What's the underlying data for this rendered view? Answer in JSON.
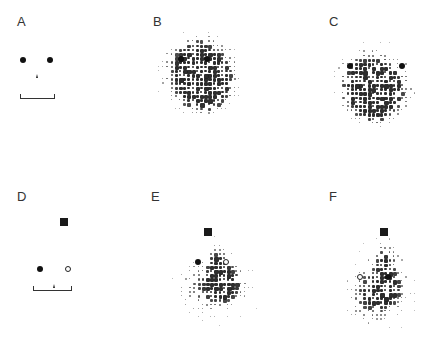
{
  "figure": {
    "panels": [
      {
        "id": "A",
        "label": "A",
        "type": "stimulus",
        "stimulus": "two-eyes-nose-mouth"
      },
      {
        "id": "B",
        "label": "B",
        "type": "fixation-density",
        "stimulus": "two-eyes"
      },
      {
        "id": "C",
        "label": "C",
        "type": "fixation-density",
        "stimulus": "two-eyes"
      },
      {
        "id": "D",
        "label": "D",
        "type": "stimulus",
        "stimulus": "square-filled-eye-open-eye-nose-mouth"
      },
      {
        "id": "E",
        "label": "E",
        "type": "fixation-density",
        "stimulus": "square-filled-eye-open-eye"
      },
      {
        "id": "F",
        "label": "F",
        "type": "fixation-density",
        "stimulus": "square-open-eye-filled-eye"
      }
    ],
    "colors": {
      "ink": "#111111",
      "background": "#ffffff"
    }
  }
}
